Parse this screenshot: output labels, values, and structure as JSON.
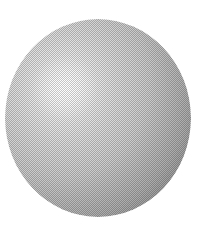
{
  "image": {
    "kind": "shaded-sphere-illustration",
    "canvas_width": 209,
    "canvas_height": 236,
    "background_color": "#ffffff",
    "caption": ""
  },
  "sphere": {
    "label": "sphere",
    "center_x": 98,
    "center_y": 118,
    "radius_x": 93,
    "radius_y": 99,
    "bbox_left": 5,
    "bbox_top": 19,
    "bbox_right": 191,
    "bbox_bottom": 217,
    "surface_texture": "halftone-dither",
    "fill_style": "radial-gradient",
    "highlight": {
      "label": "specular-highlight",
      "center_x_pct": 32,
      "center_y_pct": 35,
      "color": "#fdfdfd"
    },
    "shading_stops": [
      {
        "offset_pct": 0,
        "color": "#fbfbfb"
      },
      {
        "offset_pct": 10,
        "color": "#f4f4f4"
      },
      {
        "offset_pct": 22,
        "color": "#e8e8e8"
      },
      {
        "offset_pct": 36,
        "color": "#dcdcdc"
      },
      {
        "offset_pct": 50,
        "color": "#d2d2d2"
      },
      {
        "offset_pct": 64,
        "color": "#c7c7c7"
      },
      {
        "offset_pct": 78,
        "color": "#bcbcbc"
      },
      {
        "offset_pct": 90,
        "color": "#b2b2b2"
      },
      {
        "offset_pct": 100,
        "color": "#a9a9a9"
      }
    ],
    "rim_shadow_color": "#9c9c9c",
    "lightest_value": "#fdfdfd",
    "darkest_value": "#9c9c9c"
  }
}
